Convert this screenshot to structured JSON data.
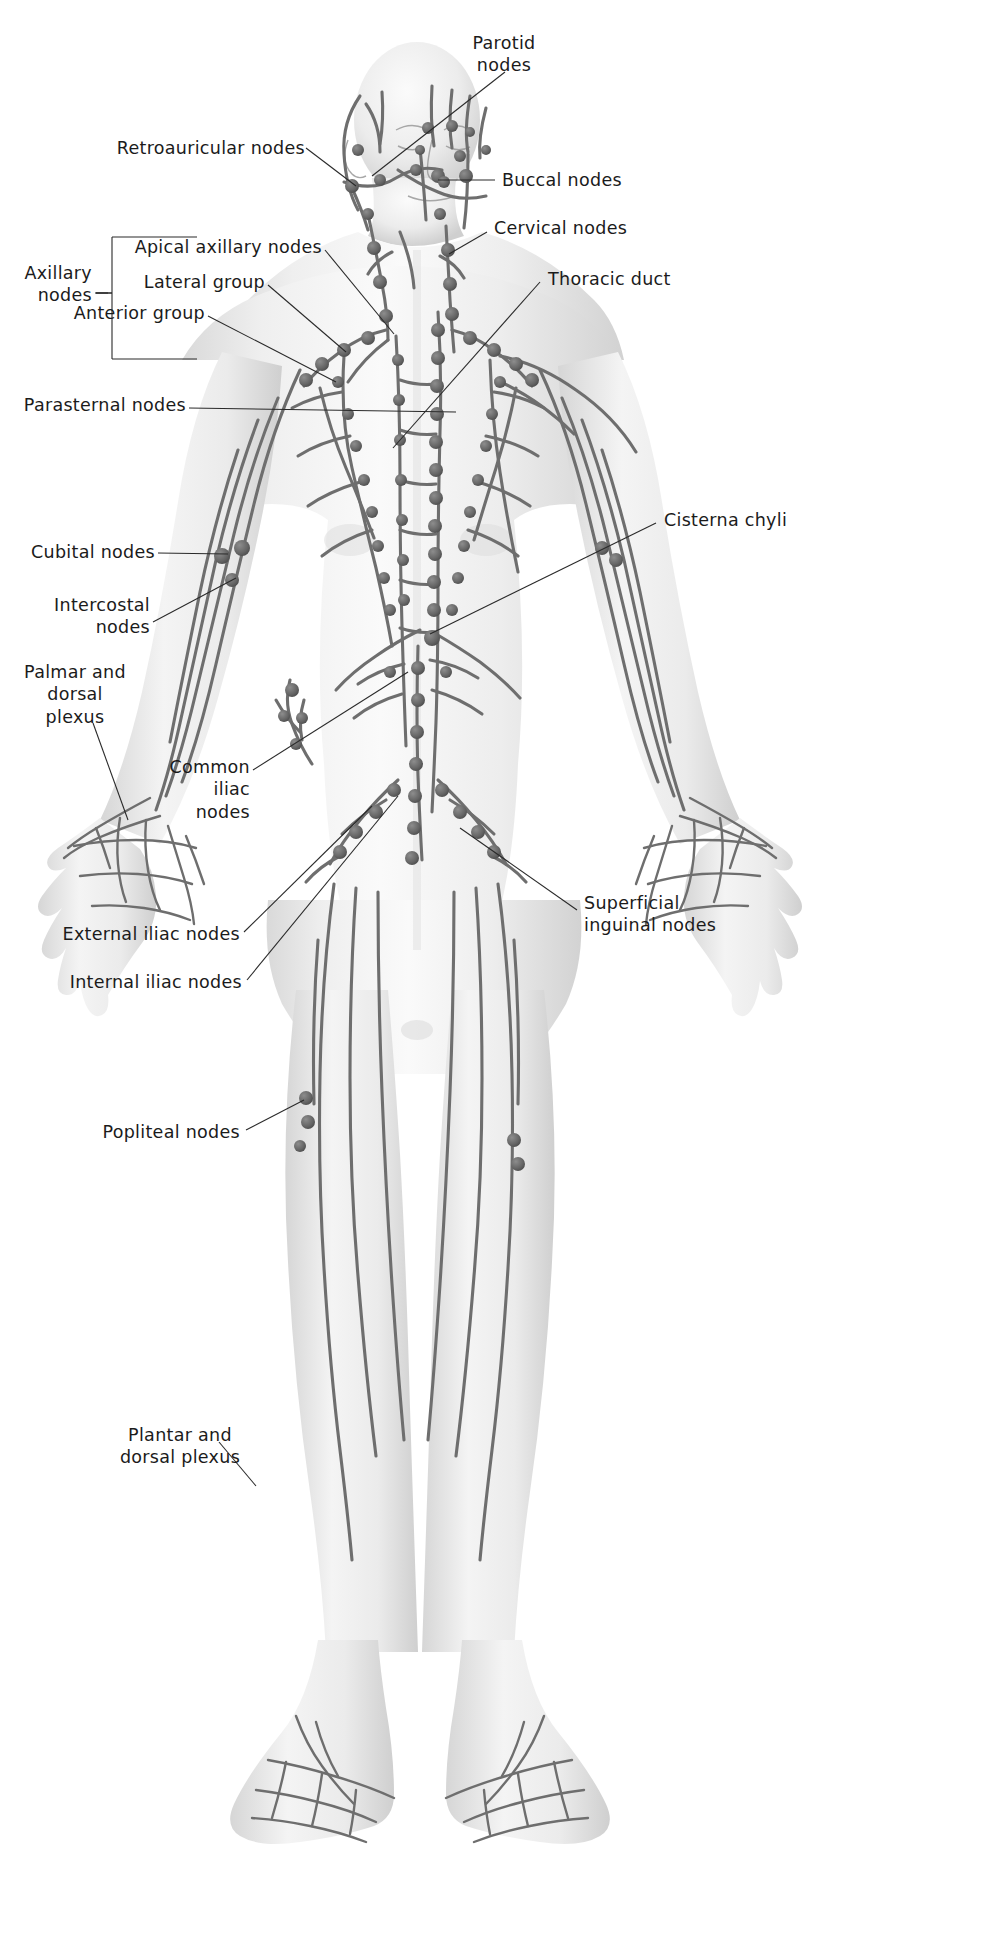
{
  "figure": {
    "view": "anterior",
    "colors": {
      "background": "#ffffff",
      "body_fill_light": "#f2f2f2",
      "body_fill_mid": "#e3e3e3",
      "body_shadow": "#c9c9c9",
      "vessel": "#6e6e6e",
      "node": "#606060",
      "leader_line": "#2a2a2a",
      "label_text": "#1b1b1b"
    }
  },
  "group_labels": [
    {
      "id": "axillary-nodes-group",
      "text": "Axillary\nnodes",
      "members": [
        "Apical axillary nodes",
        "Lateral group",
        "Anterior group"
      ]
    }
  ],
  "labels": [
    {
      "id": "parotid-nodes",
      "text": "Parotid\nnodes",
      "side": "right",
      "align": "center"
    },
    {
      "id": "retroauricular-nodes",
      "text": "Retroauricular nodes",
      "side": "left",
      "align": "right"
    },
    {
      "id": "buccal-nodes",
      "text": "Buccal nodes",
      "side": "right",
      "align": "left"
    },
    {
      "id": "cervical-nodes",
      "text": "Cervical nodes",
      "side": "right",
      "align": "left"
    },
    {
      "id": "thoracic-duct",
      "text": "Thoracic duct",
      "side": "right",
      "align": "left"
    },
    {
      "id": "apical-axillary-nodes",
      "text": "Apical axillary nodes",
      "side": "left",
      "align": "right"
    },
    {
      "id": "lateral-group",
      "text": "Lateral group",
      "side": "left",
      "align": "right"
    },
    {
      "id": "anterior-group",
      "text": "Anterior group",
      "side": "left",
      "align": "right"
    },
    {
      "id": "parasternal-nodes",
      "text": "Parasternal nodes",
      "side": "left",
      "align": "right"
    },
    {
      "id": "cisterna-chyli",
      "text": "Cisterna chyli",
      "side": "right",
      "align": "left"
    },
    {
      "id": "cubital-nodes",
      "text": "Cubital nodes",
      "side": "left",
      "align": "right"
    },
    {
      "id": "intercostal-nodes",
      "text": "Intercostal\nnodes",
      "side": "left",
      "align": "right"
    },
    {
      "id": "palmar-dorsal-plexus",
      "text": "Palmar and\ndorsal\nplexus",
      "side": "left",
      "align": "center"
    },
    {
      "id": "common-iliac-nodes",
      "text": "Common\niliac\nnodes",
      "side": "left",
      "align": "right"
    },
    {
      "id": "external-iliac-nodes",
      "text": "External iliac nodes",
      "side": "left",
      "align": "right"
    },
    {
      "id": "internal-iliac-nodes",
      "text": "Internal iliac nodes",
      "side": "left",
      "align": "right"
    },
    {
      "id": "superficial-inguinal-nodes",
      "text": "Superficial\ninguinal nodes",
      "side": "right",
      "align": "left"
    },
    {
      "id": "popliteal-nodes",
      "text": "Popliteal nodes",
      "side": "left",
      "align": "right"
    },
    {
      "id": "plantar-dorsal-plexus",
      "text": "Plantar and\ndorsal plexus",
      "side": "left",
      "align": "center"
    }
  ]
}
